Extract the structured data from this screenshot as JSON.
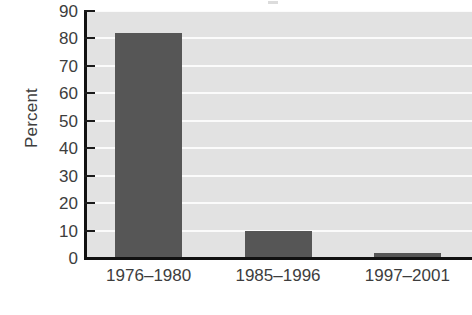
{
  "chart_data": {
    "type": "bar",
    "title": "",
    "subtitle": "",
    "xlabel": "",
    "ylabel": "Percent",
    "categories": [
      "1976–1980",
      "1985–1996",
      "1997–2001"
    ],
    "values": [
      82,
      10,
      2
    ],
    "series": [
      {
        "name": "Percent",
        "values": [
          82,
          10,
          2
        ]
      }
    ],
    "ylim": [
      0,
      90
    ],
    "yticks": [
      0,
      10,
      20,
      30,
      40,
      50,
      60,
      70,
      80,
      90
    ],
    "ytick_labels": [
      "0",
      "10",
      "20",
      "30",
      "40",
      "50",
      "60",
      "70",
      "80",
      "90"
    ],
    "grid": true,
    "grid_axis": "y",
    "legend": false,
    "legend_position": "none",
    "annotations": [],
    "colors": {
      "bar": "#565656",
      "plot_background": "#e2e2e2",
      "gridline": "#fbfbfb",
      "axis": "#111111",
      "text": "#3d3d3d",
      "figure_background": "#ffffff"
    }
  }
}
